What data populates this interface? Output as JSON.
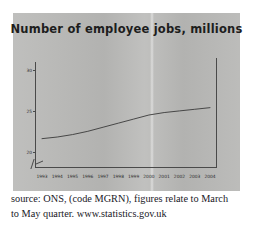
{
  "chart_data": {
    "type": "line",
    "title": "Number of employee jobs, millions",
    "xlabel": "",
    "ylabel": "",
    "ylim": [
      18,
      31
    ],
    "yticks": [
      30,
      25,
      20
    ],
    "grid": false,
    "legend": false,
    "x": [
      1993,
      1994,
      1995,
      1996,
      1997,
      1998,
      1999,
      2000,
      2001,
      2002,
      2003,
      2004
    ],
    "categories": [
      "1993",
      "1994",
      "1995",
      "1996",
      "1997",
      "1998",
      "1999",
      "2000",
      "2001",
      "2002",
      "2003",
      "2004"
    ],
    "series": [
      {
        "name": "Employee jobs",
        "values": [
          21.6,
          21.8,
          22.1,
          22.5,
          23.0,
          23.5,
          24.0,
          24.5,
          24.8,
          25.0,
          25.2,
          25.4
        ]
      }
    ],
    "line_color": "#3a3a3a"
  },
  "source": {
    "line1": "source: ONS, (code MGRN), figures relate to March",
    "line2": "to May quarter. www.statistics.gov.uk"
  }
}
